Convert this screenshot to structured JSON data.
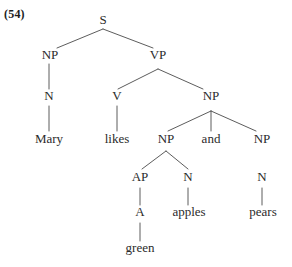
{
  "figure": {
    "example_number": "(54)",
    "sentence": "Mary likes green apples and pears",
    "ink_color": "#2b2b2b",
    "line_color": "#4a4a4a",
    "background_color": "#ffffff"
  },
  "nodes": [
    {
      "id": "s",
      "label": "S",
      "kind": "category",
      "x": 103,
      "y": 24
    },
    {
      "id": "np1",
      "label": "NP",
      "kind": "category",
      "x": 50,
      "y": 59
    },
    {
      "id": "vp",
      "label": "VP",
      "kind": "category",
      "x": 158,
      "y": 59
    },
    {
      "id": "n1",
      "label": "N",
      "kind": "category",
      "x": 49,
      "y": 100
    },
    {
      "id": "v",
      "label": "V",
      "kind": "category",
      "x": 117,
      "y": 100
    },
    {
      "id": "np2",
      "label": "NP",
      "kind": "category",
      "x": 211,
      "y": 100
    },
    {
      "id": "mary",
      "label": "Mary",
      "kind": "terminal",
      "x": 49,
      "y": 143
    },
    {
      "id": "likes",
      "label": "likes",
      "kind": "terminal",
      "x": 117,
      "y": 143
    },
    {
      "id": "np3",
      "label": "NP",
      "kind": "category",
      "x": 166,
      "y": 143
    },
    {
      "id": "and",
      "label": "and",
      "kind": "terminal",
      "x": 211,
      "y": 143
    },
    {
      "id": "np4",
      "label": "NP",
      "kind": "category",
      "x": 262,
      "y": 143
    },
    {
      "id": "ap",
      "label": "AP",
      "kind": "category",
      "x": 140,
      "y": 181
    },
    {
      "id": "n2",
      "label": "N",
      "kind": "category",
      "x": 188,
      "y": 181
    },
    {
      "id": "n3",
      "label": "N",
      "kind": "category",
      "x": 262,
      "y": 181
    },
    {
      "id": "a",
      "label": "A",
      "kind": "category",
      "x": 140,
      "y": 216
    },
    {
      "id": "apples",
      "label": "apples",
      "kind": "terminal",
      "x": 189,
      "y": 216
    },
    {
      "id": "pears",
      "label": "pears",
      "kind": "terminal",
      "x": 263,
      "y": 216
    },
    {
      "id": "green",
      "label": "green",
      "kind": "terminal",
      "x": 140,
      "y": 252
    }
  ],
  "edges": [
    {
      "from": "s",
      "to": "np1",
      "type": "branch",
      "x1": 103,
      "y1": 29,
      "x2": 57,
      "y2": 48
    },
    {
      "from": "s",
      "to": "vp",
      "type": "branch",
      "x1": 103,
      "y1": 29,
      "x2": 153,
      "y2": 48
    },
    {
      "from": "np1",
      "to": "n1",
      "type": "connector",
      "x1": 49,
      "y1": 64,
      "x2": 49,
      "y2": 89
    },
    {
      "from": "vp",
      "to": "v",
      "type": "branch",
      "x1": 158,
      "y1": 69,
      "x2": 118,
      "y2": 89
    },
    {
      "from": "vp",
      "to": "np2",
      "type": "branch",
      "x1": 158,
      "y1": 69,
      "x2": 203,
      "y2": 89
    },
    {
      "from": "n1",
      "to": "mary",
      "type": "connector",
      "x1": 49,
      "y1": 106,
      "x2": 49,
      "y2": 131
    },
    {
      "from": "v",
      "to": "likes",
      "type": "connector",
      "x1": 117,
      "y1": 106,
      "x2": 117,
      "y2": 131
    },
    {
      "from": "np2",
      "to": "np3",
      "type": "branch",
      "x1": 211,
      "y1": 111,
      "x2": 168,
      "y2": 131
    },
    {
      "from": "np2",
      "to": "and",
      "type": "connector",
      "x1": 211,
      "y1": 111,
      "x2": 211,
      "y2": 131
    },
    {
      "from": "np2",
      "to": "np4",
      "type": "branch",
      "x1": 211,
      "y1": 111,
      "x2": 256,
      "y2": 131
    },
    {
      "from": "np3",
      "to": "ap",
      "type": "branch",
      "x1": 166,
      "y1": 151,
      "x2": 142,
      "y2": 169
    },
    {
      "from": "np3",
      "to": "n2",
      "type": "branch",
      "x1": 166,
      "y1": 151,
      "x2": 188,
      "y2": 169
    },
    {
      "from": "ap",
      "to": "a",
      "type": "connector",
      "x1": 140,
      "y1": 188,
      "x2": 140,
      "y2": 205
    },
    {
      "from": "n2",
      "to": "apples",
      "type": "connector",
      "x1": 188,
      "y1": 188,
      "x2": 188,
      "y2": 205
    },
    {
      "from": "n3",
      "to": "pears",
      "type": "connector",
      "x1": 262,
      "y1": 188,
      "x2": 262,
      "y2": 205
    },
    {
      "from": "a",
      "to": "green",
      "type": "connector",
      "x1": 140,
      "y1": 223,
      "x2": 140,
      "y2": 241
    }
  ]
}
